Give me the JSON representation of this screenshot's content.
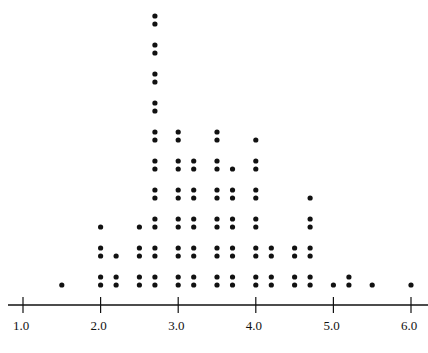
{
  "chart_data": {
    "type": "scatter",
    "subtype": "dot plot",
    "title": "",
    "xlabel": "",
    "ylabel": "",
    "xlim": [
      1.0,
      6.0
    ],
    "x_ticks": [
      "1.0",
      "2.0",
      "3.0",
      "4.0",
      "5.0",
      "6.0"
    ],
    "grid": false,
    "columns": [
      {
        "x": 1.5,
        "count": 1
      },
      {
        "x": 2.0,
        "count": 5
      },
      {
        "x": 2.2,
        "count": 3
      },
      {
        "x": 2.5,
        "count": 5
      },
      {
        "x": 2.7,
        "count": 20
      },
      {
        "x": 3.0,
        "count": 12
      },
      {
        "x": 3.2,
        "count": 10
      },
      {
        "x": 3.5,
        "count": 12
      },
      {
        "x": 3.7,
        "count": 9
      },
      {
        "x": 4.0,
        "count": 11
      },
      {
        "x": 4.2,
        "count": 4
      },
      {
        "x": 4.5,
        "count": 4
      },
      {
        "x": 4.7,
        "count": 7
      },
      {
        "x": 5.0,
        "count": 1
      },
      {
        "x": 5.2,
        "count": 2
      },
      {
        "x": 5.5,
        "count": 1
      },
      {
        "x": 6.0,
        "count": 1
      }
    ]
  },
  "colors": {
    "dot": "#111111",
    "axis": "#111111"
  }
}
